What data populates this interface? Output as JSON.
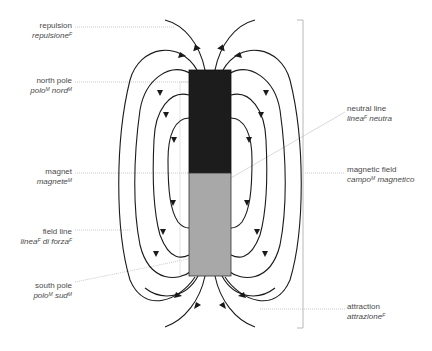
{
  "diagram": {
    "colors": {
      "north_pole": "#1c1c1c",
      "south_pole": "#a8a8a8",
      "field_line": "#1a1a1a",
      "leader_line": "#bdbdbd",
      "label_text": "#4a4a4a"
    },
    "labels_left": [
      {
        "id": "repulsion",
        "en": "repulsion",
        "it": "repulsione",
        "gender": "F"
      },
      {
        "id": "north-pole",
        "en": "north pole",
        "it": "polo",
        "gender": "M",
        "it2": "nord",
        "gender2": "M"
      },
      {
        "id": "magnet",
        "en": "magnet",
        "it": "magnete",
        "gender": "M"
      },
      {
        "id": "field-line",
        "en": "field line",
        "it": "linea",
        "gender": "F",
        "it2": "di forza",
        "gender2": "F"
      },
      {
        "id": "south-pole",
        "en": "south pole",
        "it": "polo",
        "gender": "M",
        "it2": "sud",
        "gender2": "M"
      }
    ],
    "labels_right": [
      {
        "id": "neutral-line",
        "en": "neutral line",
        "it": "linea",
        "gender": "F",
        "it2": "neutra"
      },
      {
        "id": "magnetic-field",
        "en": "magnetic field",
        "it": "campo",
        "gender": "M",
        "it2": "magnetico"
      },
      {
        "id": "attraction",
        "en": "attraction",
        "it": "attrazione",
        "gender": "F"
      }
    ]
  }
}
